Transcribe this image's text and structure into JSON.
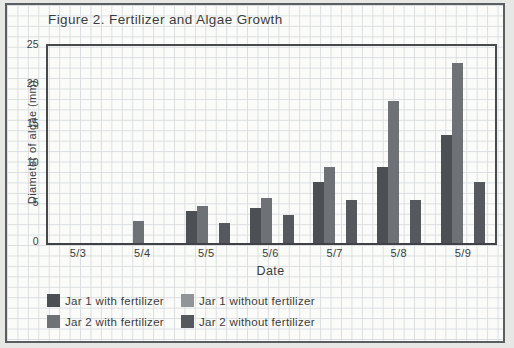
{
  "figure": {
    "title": "Figure 2. Fertilizer and Algae Growth"
  },
  "chart_data": {
    "type": "bar",
    "title": "Figure 2. Fertilizer and Algae Growth",
    "xlabel": "Date",
    "ylabel": "Diameter of algae (mm)",
    "categories": [
      "5/3",
      "5/4",
      "5/5",
      "5/6",
      "5/7",
      "5/8",
      "5/9"
    ],
    "series": [
      {
        "name": "Jar 1 with fertilizer",
        "color": "#4c5055",
        "values": [
          0,
          0,
          4.1,
          4.5,
          7.7,
          9.7,
          13.7
        ]
      },
      {
        "name": "Jar 2 with fertilizer",
        "color": "#6e7175",
        "values": [
          0,
          2.8,
          4.7,
          5.7,
          9.6,
          18,
          22.8
        ]
      },
      {
        "name": "Jar 1 without fertilizer",
        "color": "#929597",
        "values": [
          0,
          0,
          0,
          0,
          0,
          0,
          0
        ]
      },
      {
        "name": "Jar 2 without fertilizer",
        "color": "#55585c",
        "values": [
          0,
          0,
          2.5,
          3.5,
          5.4,
          5.4,
          7.7
        ]
      }
    ],
    "ylim": [
      0,
      25
    ],
    "yticks": [
      25,
      20,
      15,
      10,
      5,
      0
    ],
    "grid": "graph-paper background, no inner plot gridlines",
    "legend_position": "bottom-left, 2 columns"
  },
  "legend": {
    "items": [
      {
        "label": "Jar 1 with fertilizer",
        "color": "#4c5055"
      },
      {
        "label": "Jar 1 without fertilizer",
        "color": "#929597"
      },
      {
        "label": "Jar 2 with fertilizer",
        "color": "#6e7175"
      },
      {
        "label": "Jar 2 without fertilizer",
        "color": "#55585c"
      }
    ]
  },
  "colors": {
    "page_background": "#e7e7e5",
    "paper": "#fbfbf9",
    "grid_line": "#dadee1",
    "frame_border": "#5b5e61",
    "axis": "#47494c",
    "text": "#3a3d40"
  }
}
